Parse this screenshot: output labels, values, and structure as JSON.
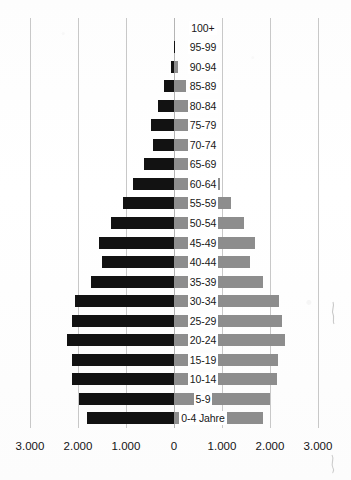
{
  "chart_data": {
    "type": "bar",
    "subtype": "population-pyramid",
    "title": "",
    "xlabel": "",
    "ylabel": "",
    "orientation": "horizontal",
    "grid": true,
    "legend_position": "none",
    "xlim": [
      -3000,
      3000
    ],
    "xticks": [
      -3000,
      -2000,
      -1000,
      0,
      1000,
      2000,
      3000
    ],
    "xtick_labels": [
      "3.000",
      "2.000",
      "1.000",
      "0",
      "1.000",
      "2.000",
      "3.000"
    ],
    "unit_per_gridline": 1000,
    "categories": [
      "100+",
      "95-99",
      "90-94",
      "85-89",
      "80-84",
      "75-79",
      "70-74",
      "65-69",
      "60-64",
      "55-59",
      "50-54",
      "45-49",
      "40-44",
      "35-39",
      "30-34",
      "25-29",
      "20-24",
      "15-19",
      "10-14",
      "5-9",
      "0-4 Jahre"
    ],
    "series": [
      {
        "name": "left",
        "side": "left",
        "color": "#121212",
        "values": [
          0,
          10,
          60,
          200,
          330,
          480,
          440,
          620,
          850,
          1060,
          1320,
          1560,
          1500,
          1730,
          2060,
          2130,
          2230,
          2120,
          2120,
          1980,
          1820
        ]
      },
      {
        "name": "right",
        "side": "right",
        "color": "#8d8d8d",
        "values": [
          0,
          20,
          80,
          240,
          420,
          560,
          540,
          720,
          960,
          1180,
          1450,
          1680,
          1590,
          1860,
          2180,
          2250,
          2320,
          2160,
          2150,
          2010,
          1850
        ]
      }
    ]
  },
  "colors": {
    "left_bar": "#121212",
    "right_bar": "#8d8d8d",
    "gridline": "#c8c8c8",
    "background": "#ffffff",
    "text": "#171717"
  }
}
